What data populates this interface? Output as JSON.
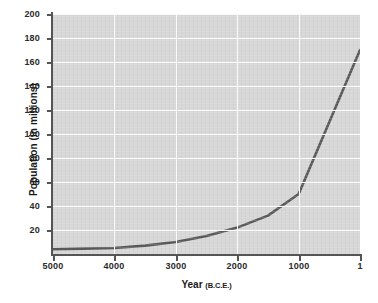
{
  "chart_data": {
    "type": "line",
    "title": "",
    "xlabel": "Year",
    "xlabel_era": "(B.C.E.)",
    "ylabel": "Population (in millions)",
    "x_tick_labels": [
      "5000",
      "4000",
      "3000",
      "2000",
      "1000",
      "1"
    ],
    "x_tick_values": [
      5000,
      4000,
      3000,
      2000,
      1000,
      1
    ],
    "y_tick_labels": [
      "20",
      "40",
      "60",
      "80",
      "100",
      "120",
      "140",
      "160",
      "180",
      "200"
    ],
    "y_tick_values": [
      20,
      40,
      60,
      80,
      100,
      120,
      140,
      160,
      180,
      200
    ],
    "xlim": [
      5000,
      1
    ],
    "ylim": [
      0,
      200
    ],
    "x_axis_direction": "descending",
    "grid": true,
    "grid_color": "#fbfbfb",
    "plot_background": "#d7d7d7",
    "line_color": "#5a5a5a",
    "line_width": 2.6,
    "legend": "none",
    "series": [
      {
        "name": "World population",
        "x": [
          5000,
          4500,
          4000,
          3500,
          3000,
          2500,
          2000,
          1500,
          1000,
          1
        ],
        "values": [
          4,
          4.5,
          5,
          7,
          10,
          15,
          22,
          32,
          50,
          170
        ]
      }
    ]
  }
}
